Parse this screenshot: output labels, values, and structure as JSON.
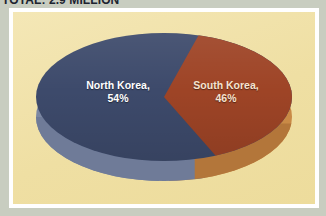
{
  "header": {
    "title": "TOTAL: 2.9 MILLION"
  },
  "chart_data": {
    "type": "pie",
    "title": "TOTAL: 2.9 MILLION",
    "subtitle": "",
    "xlabel": "",
    "ylabel": "",
    "three_d": true,
    "legend_position": "none",
    "grid": false,
    "categories": [
      "North Korea",
      "South Korea"
    ],
    "values": [
      54,
      46
    ],
    "units": "percent",
    "slices": [
      {
        "label": "North Korea",
        "value": 54,
        "value_text": "54%",
        "label_line1": "North Korea,",
        "label_line2": "54%",
        "color": "#3d4a6b",
        "side_color": "#7c88a3",
        "text_color": "#ffffff"
      },
      {
        "label": "South Korea",
        "value": 46,
        "value_text": "46%",
        "label_line1": "South Korea,",
        "label_line2": "46%",
        "color": "#9e4426",
        "side_color": "#c98a46",
        "text_color": "#f6e3cf"
      }
    ]
  },
  "style": {
    "page_background": "#c8cdc0",
    "frame_color": "#ffffff",
    "plot_background": "#f2e3ad",
    "title_color": "#1d2430"
  }
}
